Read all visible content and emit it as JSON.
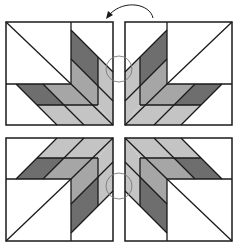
{
  "diagram": {
    "colors": {
      "background": "#ffffff",
      "outline": "#1a1a1a",
      "dark": "#6e6e6e",
      "medium": "#a6a6a6",
      "light": "#c4c4c4",
      "white": "#ffffff",
      "marker": "#7a7a7a"
    },
    "blocks": [
      {
        "name": "top-left",
        "mirror_x": false,
        "mirror_y": false
      },
      {
        "name": "top-right",
        "mirror_x": true,
        "mirror_y": false
      },
      {
        "name": "bottom-left",
        "mirror_x": false,
        "mirror_y": true
      },
      {
        "name": "bottom-right",
        "mirror_x": true,
        "mirror_y": true
      }
    ],
    "annotations": [
      {
        "type": "rotation-arrow",
        "direction": "counterclockwise",
        "position": "top-center"
      },
      {
        "type": "seam-circle",
        "position": "top-center"
      },
      {
        "type": "seam-circle",
        "position": "bottom-center"
      }
    ]
  }
}
